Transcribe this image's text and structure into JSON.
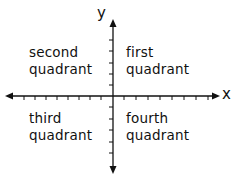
{
  "diagram": {
    "axes": {
      "x_label": "x",
      "y_label": "y",
      "x_ticks_left": 8,
      "x_ticks_right": 8,
      "y_ticks_up": 5,
      "y_ticks_down": 5,
      "color": "#111111"
    },
    "quadrants": {
      "first": {
        "line1": "first",
        "line2": "quadrant"
      },
      "second": {
        "line1": "second",
        "line2": "quadrant"
      },
      "third": {
        "line1": "third",
        "line2": "quadrant"
      },
      "fourth": {
        "line1": "fourth",
        "line2": "quadrant"
      }
    }
  }
}
